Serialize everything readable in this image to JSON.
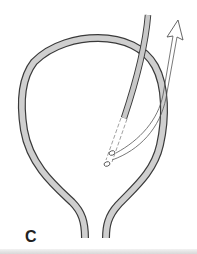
{
  "figure": {
    "panel_label": "C",
    "colors": {
      "wall_fill": "#cfcfcf",
      "outline": "#3a3a3a",
      "catheter_fill": "#c8c8c8",
      "arrow_stroke": "#555555",
      "background": "#ffffff",
      "bottom_bar": "#dcdcdc"
    },
    "elements": {
      "bladder_wall": "bladder-wall",
      "catheter": "catheter-tube",
      "catheter_tip": "catheter-dashed-tip",
      "eyelets": "catheter-eyelets",
      "arrow": "direction-arrow"
    }
  }
}
